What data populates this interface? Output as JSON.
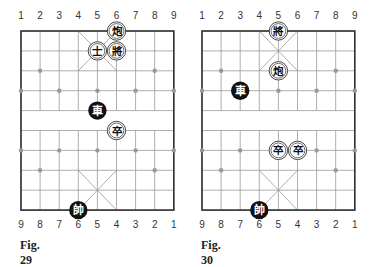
{
  "figures": [
    {
      "caption": "Fig. 29",
      "top_numbers": [
        "1",
        "2",
        "3",
        "4",
        "5",
        "6",
        "7",
        "8",
        "9"
      ],
      "bottom_numbers": [
        "9",
        "8",
        "7",
        "6",
        "5",
        "4",
        "3",
        "2",
        "1"
      ],
      "pieces": [
        {
          "glyph": "炮",
          "side": "white",
          "col": 5,
          "row": 0,
          "name": "cannon"
        },
        {
          "glyph": "士",
          "side": "white",
          "col": 4,
          "row": 1,
          "name": "advisor"
        },
        {
          "glyph": "將",
          "side": "white",
          "col": 5,
          "row": 1,
          "name": "general"
        },
        {
          "glyph": "車",
          "side": "black",
          "col": 4,
          "row": 4,
          "name": "chariot"
        },
        {
          "glyph": "卒",
          "side": "white",
          "col": 5,
          "row": 5,
          "name": "soldier"
        },
        {
          "glyph": "帥",
          "side": "black",
          "col": 3,
          "row": 9,
          "name": "marshal"
        }
      ]
    },
    {
      "caption": "Fig. 30",
      "top_numbers": [
        "1",
        "2",
        "3",
        "4",
        "5",
        "6",
        "7",
        "8",
        "9"
      ],
      "bottom_numbers": [
        "9",
        "8",
        "7",
        "6",
        "5",
        "4",
        "3",
        "2",
        "1"
      ],
      "pieces": [
        {
          "glyph": "將",
          "side": "white",
          "col": 4,
          "row": 0,
          "name": "general"
        },
        {
          "glyph": "炮",
          "side": "white",
          "col": 4,
          "row": 2,
          "name": "cannon"
        },
        {
          "glyph": "車",
          "side": "black",
          "col": 2,
          "row": 3,
          "name": "chariot"
        },
        {
          "glyph": "卒",
          "side": "white",
          "col": 4,
          "row": 6,
          "name": "soldier"
        },
        {
          "glyph": "卒",
          "side": "white",
          "col": 5,
          "row": 6,
          "name": "soldier"
        },
        {
          "glyph": "帥",
          "side": "black",
          "col": 3,
          "row": 9,
          "name": "marshal"
        }
      ]
    }
  ],
  "colors": {
    "grid": "#9a9a9a",
    "border": "#333333",
    "black_piece": "#111111",
    "white_piece": "#ffffff",
    "marker": "#999999"
  }
}
